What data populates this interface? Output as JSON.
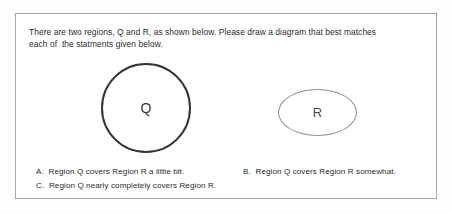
{
  "document": {
    "prompt": {
      "line1": "There are two regions, Q and R, as shown below. Please draw a diagram that best matches",
      "line2": "each of  the statments given below."
    },
    "diagram": {
      "region_q": {
        "label": "Q",
        "shape": "circle",
        "stroke_color": "#333333"
      },
      "region_r": {
        "label": "R",
        "shape": "ellipse",
        "stroke_color": "#8e8e8e"
      }
    },
    "options": [
      {
        "id": "A",
        "text": "A.  Region Q covers Region R a little bit."
      },
      {
        "id": "B",
        "text": "B.  Region Q covers Region R somewhat."
      },
      {
        "id": "C",
        "text": "C.  Region Q nearly completely covers Region R."
      }
    ],
    "frame": {
      "border_color": "#a6a6a6",
      "background": "#ffffff"
    }
  }
}
